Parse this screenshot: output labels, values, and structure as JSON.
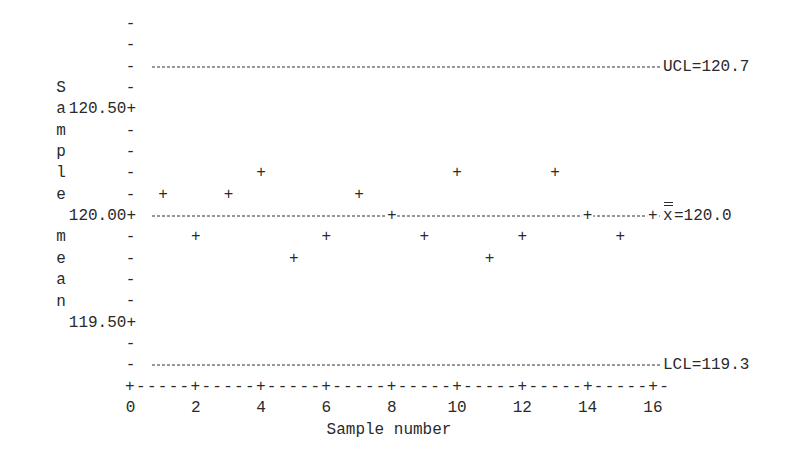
{
  "chart_data": {
    "type": "scatter",
    "title": "",
    "subtitle": "X-bar control chart (character plot)",
    "xlabel": "Sample number",
    "ylabel": "Sample mean",
    "x_ticks": [
      0,
      2,
      4,
      6,
      8,
      10,
      12,
      14,
      16
    ],
    "y_ticks": [
      "120.50",
      "120.00",
      "119.50"
    ],
    "xlim": [
      0,
      16
    ],
    "ylim": [
      119.2,
      120.9
    ],
    "grid": false,
    "legend": null,
    "series": [
      {
        "name": "Sample mean",
        "x": [
          1,
          2,
          3,
          4,
          5,
          6,
          7,
          8,
          9,
          10,
          11,
          12,
          13,
          14,
          15,
          16
        ],
        "values": [
          120.1,
          119.9,
          120.1,
          120.2,
          119.8,
          119.9,
          120.1,
          120.0,
          119.9,
          120.2,
          119.8,
          119.9,
          120.2,
          120.0,
          119.9,
          120.0
        ]
      }
    ],
    "reference_lines": [
      {
        "name": "UCL",
        "value": 120.7,
        "label": "UCL=120.7"
      },
      {
        "name": "Center",
        "value": 120.0,
        "label": "=120.0",
        "symbol": "x-double-bar"
      },
      {
        "name": "LCL",
        "value": 119.3,
        "label": "LCL=119.3"
      }
    ]
  },
  "labels": {
    "ylabel_chars": [
      "S",
      "a",
      "m",
      "p",
      "l",
      "e",
      "",
      "m",
      "e",
      "a",
      "n"
    ],
    "xlabel": "Sample number",
    "ucl": "UCL=120.7",
    "lcl": "LCL=119.3",
    "center": "=120.0",
    "ytick_120_50": "120.50+",
    "ytick_120_00": "120.00+",
    "ytick_119_50": "119.50+"
  }
}
